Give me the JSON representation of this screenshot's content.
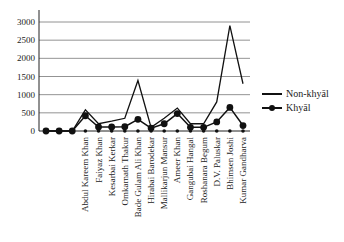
{
  "chart_data": {
    "type": "line",
    "title": "",
    "xlabel": "",
    "ylabel": "",
    "ylim": [
      0,
      3000
    ],
    "yticks": [
      0,
      500,
      1000,
      1500,
      2000,
      2500,
      3000
    ],
    "grid": "horizontal",
    "legend_position": "right",
    "categories": [
      "",
      "",
      "",
      "Abdul Kareem Khan",
      "Faiyaz Khan",
      "Kesarbai Kerkar",
      "Omkarnath Thakur",
      "Bade Gulam Ali Khan",
      "Hirabai Barodekar",
      "Mallikarjun Mansur",
      "Ameer Khan",
      "Gangubai Hangal",
      "Roshanara Begum",
      "D.V. Paluskar",
      "Bhimsen Joshi",
      "Kumar Gandharva"
    ],
    "series": [
      {
        "name": "Non-khyāl",
        "marker": "none",
        "values": [
          0,
          0,
          0,
          580,
          200,
          270,
          350,
          1390,
          100,
          350,
          630,
          200,
          200,
          800,
          2900,
          1300
        ]
      },
      {
        "name": "Khyāl",
        "marker": "circle",
        "values": [
          0,
          0,
          0,
          420,
          110,
          110,
          120,
          320,
          80,
          200,
          480,
          100,
          100,
          250,
          650,
          150
        ]
      },
      {
        "name": "",
        "marker": "small-dot",
        "values": [
          0,
          0,
          0,
          0,
          0,
          0,
          0,
          0,
          0,
          0,
          0,
          0,
          0,
          0,
          0,
          0
        ]
      }
    ]
  },
  "legend": {
    "items": [
      {
        "label": "Non-khyāl"
      },
      {
        "label": "Khyāl"
      }
    ]
  }
}
